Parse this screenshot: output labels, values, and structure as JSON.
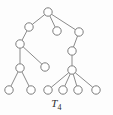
{
  "figure": {
    "label_main": "T",
    "label_sub": "4",
    "caption": "T4",
    "type": "tree-graph",
    "width": 113,
    "height": 115,
    "background_color": "#fdfdfd",
    "node_fill": "#ffffff",
    "node_stroke": "#7d7d7d",
    "edge_color": "#8a8a8a",
    "node_radius": 4.2
  },
  "graph": {
    "node_count": 15,
    "edge_count": 14,
    "nodes": [
      {
        "id": "n0",
        "name": "root",
        "x": 48,
        "y": 12
      },
      {
        "id": "n1",
        "name": "upper-left",
        "x": 29,
        "y": 27
      },
      {
        "id": "n2",
        "name": "center-child",
        "x": 57,
        "y": 31
      },
      {
        "id": "n3",
        "name": "upper-right",
        "x": 79,
        "y": 32
      },
      {
        "id": "n4",
        "name": "left-mid",
        "x": 20,
        "y": 44
      },
      {
        "id": "n5",
        "name": "right-mid",
        "x": 72,
        "y": 51
      },
      {
        "id": "n6",
        "name": "center-leaf",
        "x": 45,
        "y": 67
      },
      {
        "id": "n7",
        "name": "left-fork",
        "x": 20,
        "y": 68
      },
      {
        "id": "n8",
        "name": "right-hub",
        "x": 72,
        "y": 70
      },
      {
        "id": "n9",
        "name": "leaf-left-a",
        "x": 9,
        "y": 90
      },
      {
        "id": "n10",
        "name": "leaf-left-b",
        "x": 31,
        "y": 90
      },
      {
        "id": "n11",
        "name": "leaf-right-a",
        "x": 48,
        "y": 90
      },
      {
        "id": "n12",
        "name": "leaf-right-b",
        "x": 63,
        "y": 90
      },
      {
        "id": "n13",
        "name": "leaf-right-c",
        "x": 78,
        "y": 90
      },
      {
        "id": "n14",
        "name": "leaf-right-d",
        "x": 96,
        "y": 90
      }
    ],
    "edges": [
      {
        "from": "n0",
        "to": "n1"
      },
      {
        "from": "n0",
        "to": "n2"
      },
      {
        "from": "n0",
        "to": "n3"
      },
      {
        "from": "n1",
        "to": "n4"
      },
      {
        "from": "n3",
        "to": "n5"
      },
      {
        "from": "n4",
        "to": "n6"
      },
      {
        "from": "n4",
        "to": "n7"
      },
      {
        "from": "n5",
        "to": "n8"
      },
      {
        "from": "n7",
        "to": "n9"
      },
      {
        "from": "n7",
        "to": "n10"
      },
      {
        "from": "n8",
        "to": "n11"
      },
      {
        "from": "n8",
        "to": "n12"
      },
      {
        "from": "n8",
        "to": "n13"
      },
      {
        "from": "n8",
        "to": "n14"
      }
    ]
  }
}
